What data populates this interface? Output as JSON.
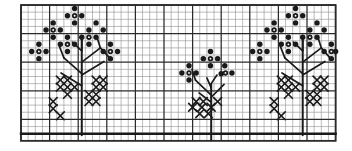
{
  "document": {
    "kind": "embroidery-pattern-chart",
    "title": "Cross-stitch flowering branch border pattern",
    "description": "Black-and-white graph-paper chart showing a repeating border of three flowering sprigs worked in cross stitches and French-knot dots.",
    "background_color": "#ffffff",
    "ink_color": "#1a1a1a",
    "grid_line_color": "#8f8f8f",
    "grid_heavy_color": "#2b2b2b"
  },
  "chart_area": {
    "frame": {
      "x": 21,
      "y": 5,
      "width": 314,
      "height": 138
    },
    "cell_size": 7.15,
    "columns": 44,
    "rows": 19,
    "heavy_every": 4,
    "baseline_row": 18,
    "baseline_label": "ground line"
  },
  "legend": {
    "symbols": [
      {
        "name": "dot-symbol",
        "glyph": "●",
        "meaning": "French knot / blossom stitch"
      },
      {
        "name": "cross-symbol",
        "glyph": "✕",
        "meaning": "cross stitch / leaf"
      },
      {
        "name": "line-symbol",
        "glyph": "|",
        "meaning": "stem stitch / branch"
      }
    ]
  },
  "motifs": [
    {
      "name": "motif-left-large",
      "origin": {
        "col": 2,
        "row": 0
      },
      "stem": {
        "x": 8.5,
        "y_top": 4.3,
        "y_bottom": 18.2
      },
      "branches": [
        [
          [
            8.5,
            9.6
          ],
          [
            6.0,
            7.4
          ]
        ],
        [
          [
            8.5,
            11.3
          ],
          [
            5.6,
            9.5
          ]
        ],
        [
          [
            8.5,
            8.0
          ],
          [
            11.1,
            6.0
          ]
        ],
        [
          [
            8.5,
            9.8
          ],
          [
            11.6,
            7.9
          ]
        ],
        [
          [
            11.1,
            6.0
          ],
          [
            12.6,
            7.6
          ]
        ],
        [
          [
            11.1,
            6.0
          ],
          [
            10.6,
            4.4
          ]
        ],
        [
          [
            6.0,
            7.4
          ],
          [
            5.3,
            5.6
          ]
        ],
        [
          [
            8.5,
            6.4
          ],
          [
            8.5,
            4.3
          ]
        ],
        [
          [
            8.5,
            6.4
          ],
          [
            7.2,
            5.2
          ]
        ]
      ],
      "dots": [
        [
          7.5,
          0.5
        ],
        [
          6.5,
          1.5
        ],
        [
          8.5,
          1.5
        ],
        [
          7.5,
          2.5
        ],
        [
          4.5,
          2.5
        ],
        [
          3.5,
          3.5
        ],
        [
          5.5,
          3.5
        ],
        [
          4.5,
          4.5
        ],
        [
          9.5,
          3.5
        ],
        [
          8.5,
          4.5
        ],
        [
          10.5,
          4.5
        ],
        [
          9.5,
          5.5
        ],
        [
          6.5,
          4.5
        ],
        [
          5.5,
          5.5
        ],
        [
          7.5,
          5.5
        ],
        [
          6.5,
          6.5
        ],
        [
          2.5,
          5.5
        ],
        [
          1.5,
          6.5
        ],
        [
          3.5,
          6.5
        ],
        [
          2.5,
          7.5
        ],
        [
          12.5,
          5.5
        ],
        [
          11.5,
          6.5
        ],
        [
          13.5,
          6.5
        ],
        [
          12.5,
          7.5
        ],
        [
          10.5,
          2.5
        ],
        [
          11.5,
          3.5
        ]
      ],
      "hollow_dots": [
        [
          7.5,
          1.5
        ],
        [
          4.5,
          3.5
        ],
        [
          9.5,
          4.5
        ],
        [
          6.5,
          5.5
        ],
        [
          2.5,
          6.5
        ],
        [
          12.5,
          6.5
        ]
      ],
      "crosses": [
        [
          5.5,
          10.5
        ],
        [
          6.5,
          10.5
        ],
        [
          10.5,
          10.5
        ],
        [
          11.5,
          10.5
        ],
        [
          5.5,
          11.5
        ],
        [
          6.5,
          11.5
        ],
        [
          7.5,
          11.5
        ],
        [
          10.5,
          11.5
        ],
        [
          11.5,
          11.5
        ],
        [
          6.5,
          12.5
        ],
        [
          9.5,
          12.5
        ],
        [
          10.5,
          12.5
        ],
        [
          4.5,
          13.5
        ],
        [
          9.5,
          13.5
        ],
        [
          4.5,
          14.5
        ],
        [
          10.5,
          13.5
        ],
        [
          5.5,
          15.5
        ]
      ]
    },
    {
      "name": "motif-center-small",
      "origin": {
        "col": 20,
        "row": 6
      },
      "stem": {
        "x": 26.6,
        "y_top": 11.0,
        "y_bottom": 18.9
      },
      "branches": [
        [
          [
            26.6,
            12.6
          ],
          [
            24.4,
            10.5
          ]
        ],
        [
          [
            26.6,
            13.6
          ],
          [
            24.9,
            12.3
          ]
        ],
        [
          [
            26.6,
            12.9
          ],
          [
            28.4,
            11.1
          ]
        ],
        [
          [
            26.6,
            11.6
          ],
          [
            26.0,
            10.2
          ]
        ],
        [
          [
            24.4,
            10.5
          ],
          [
            23.9,
            9.0
          ]
        ],
        [
          [
            26.6,
            11.0
          ],
          [
            27.4,
            9.8
          ]
        ]
      ],
      "dots": [
        [
          26.5,
          6.5
        ],
        [
          25.5,
          7.5
        ],
        [
          27.5,
          7.5
        ],
        [
          26.5,
          8.5
        ],
        [
          23.5,
          8.5
        ],
        [
          22.5,
          9.5
        ],
        [
          24.5,
          9.5
        ],
        [
          23.5,
          10.5
        ],
        [
          28.5,
          8.5
        ],
        [
          29.5,
          9.5
        ],
        [
          28.0,
          9.6
        ]
      ],
      "hollow_dots": [
        [
          26.5,
          7.5
        ],
        [
          23.5,
          9.5
        ],
        [
          28.6,
          9.5
        ]
      ],
      "crosses": [
        [
          24.5,
          13.5
        ],
        [
          25.5,
          13.5
        ],
        [
          27.5,
          13.5
        ],
        [
          24.0,
          14.3
        ],
        [
          25.3,
          14.3
        ],
        [
          26.6,
          14.3
        ],
        [
          25.0,
          15.2
        ],
        [
          26.2,
          15.2
        ]
      ]
    },
    {
      "name": "motif-right-large",
      "origin": {
        "col": 33,
        "row": 0
      },
      "stem": {
        "x": 39.4,
        "y_top": 4.3,
        "y_bottom": 18.2
      },
      "branches": [
        [
          [
            39.4,
            9.6
          ],
          [
            36.9,
            7.4
          ]
        ],
        [
          [
            39.4,
            11.3
          ],
          [
            36.5,
            9.5
          ]
        ],
        [
          [
            39.4,
            8.0
          ],
          [
            42.0,
            6.0
          ]
        ],
        [
          [
            39.4,
            9.8
          ],
          [
            42.5,
            7.9
          ]
        ],
        [
          [
            42.0,
            6.0
          ],
          [
            43.4,
            7.6
          ]
        ],
        [
          [
            42.0,
            6.0
          ],
          [
            41.5,
            4.4
          ]
        ],
        [
          [
            36.9,
            7.4
          ],
          [
            36.2,
            5.6
          ]
        ],
        [
          [
            39.4,
            6.4
          ],
          [
            39.4,
            4.3
          ]
        ],
        [
          [
            39.4,
            6.4
          ],
          [
            38.1,
            5.2
          ]
        ]
      ],
      "dots": [
        [
          38.4,
          0.5
        ],
        [
          37.4,
          1.5
        ],
        [
          39.4,
          1.5
        ],
        [
          38.4,
          2.5
        ],
        [
          35.4,
          2.5
        ],
        [
          34.4,
          3.5
        ],
        [
          36.4,
          3.5
        ],
        [
          35.4,
          4.5
        ],
        [
          40.4,
          3.5
        ],
        [
          39.4,
          4.5
        ],
        [
          41.4,
          4.5
        ],
        [
          40.4,
          5.5
        ],
        [
          37.4,
          4.5
        ],
        [
          36.4,
          5.5
        ],
        [
          38.4,
          5.5
        ],
        [
          37.4,
          6.5
        ],
        [
          33.4,
          5.5
        ],
        [
          32.4,
          6.5
        ],
        [
          34.4,
          6.5
        ],
        [
          33.4,
          7.5
        ],
        [
          43.4,
          5.5
        ],
        [
          42.4,
          6.5
        ],
        [
          44.0,
          6.5
        ],
        [
          43.4,
          7.5
        ],
        [
          41.4,
          2.5
        ],
        [
          42.4,
          3.5
        ]
      ],
      "hollow_dots": [
        [
          38.4,
          1.5
        ],
        [
          35.4,
          3.5
        ],
        [
          40.4,
          4.5
        ],
        [
          37.4,
          5.5
        ],
        [
          33.4,
          6.5
        ],
        [
          43.4,
          6.5
        ]
      ],
      "crosses": [
        [
          36.4,
          10.5
        ],
        [
          37.4,
          10.5
        ],
        [
          41.4,
          10.5
        ],
        [
          42.4,
          10.5
        ],
        [
          36.4,
          11.5
        ],
        [
          37.4,
          11.5
        ],
        [
          38.4,
          11.5
        ],
        [
          41.4,
          11.5
        ],
        [
          42.4,
          11.5
        ],
        [
          37.4,
          12.5
        ],
        [
          40.4,
          12.5
        ],
        [
          41.4,
          12.5
        ],
        [
          35.4,
          13.5
        ],
        [
          40.4,
          13.5
        ],
        [
          35.4,
          14.5
        ],
        [
          41.4,
          13.5
        ],
        [
          36.4,
          15.5
        ]
      ]
    }
  ]
}
